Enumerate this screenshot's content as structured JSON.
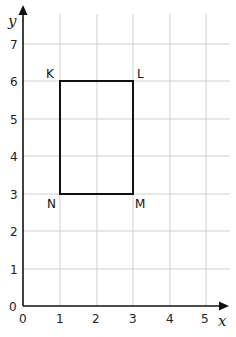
{
  "diagram": {
    "type": "coordinate-grid",
    "axes": {
      "x": {
        "label": "x",
        "ticks": [
          "0",
          "1",
          "2",
          "3",
          "4",
          "5"
        ],
        "range": [
          0,
          5.5
        ]
      },
      "y": {
        "label": "y",
        "ticks": [
          "0",
          "1",
          "2",
          "3",
          "4",
          "5",
          "6",
          "7"
        ],
        "range": [
          0,
          7.6
        ]
      }
    },
    "shape": {
      "kind": "rectangle",
      "vertices": [
        {
          "name": "K",
          "x": 1,
          "y": 6
        },
        {
          "name": "L",
          "x": 3,
          "y": 6
        },
        {
          "name": "M",
          "x": 3,
          "y": 3
        },
        {
          "name": "N",
          "x": 1,
          "y": 3
        }
      ]
    },
    "colors": {
      "grid": "#cfcfcf",
      "axis": "#111111",
      "shape": "#111111"
    }
  }
}
